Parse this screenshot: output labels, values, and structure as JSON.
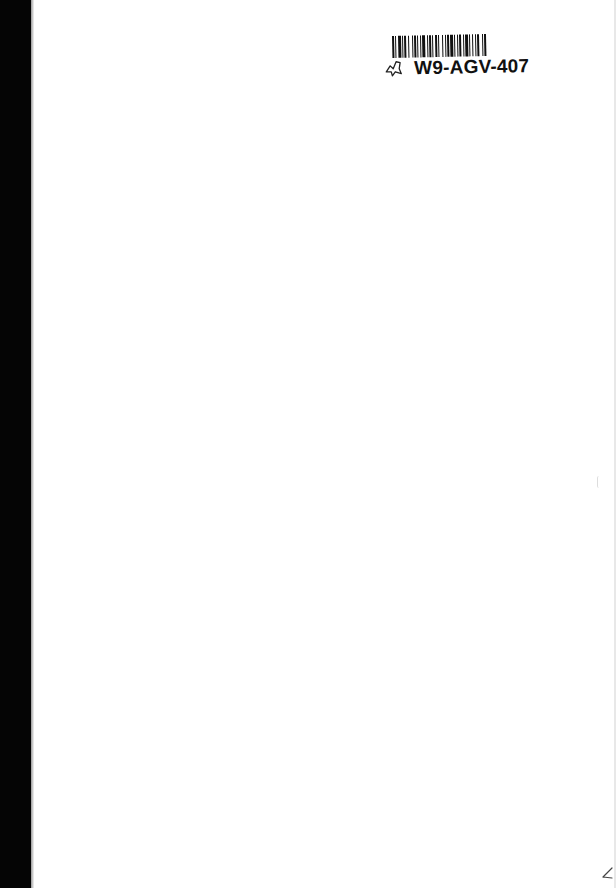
{
  "document": {
    "type": "scanned blank page",
    "background_color": "#ffffff",
    "spine_color": "#050505"
  },
  "sticker": {
    "barcode_icon": "barcode-icon",
    "code": "W9-AGV-407",
    "handwritten_mark_icon": "handwritten-leaf-mark-icon"
  },
  "annotations": {
    "corner_mark_icon": "pencil-check-mark-icon"
  }
}
